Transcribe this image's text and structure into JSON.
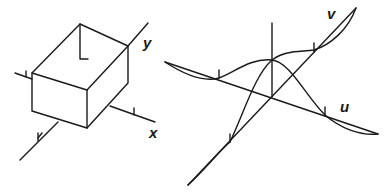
{
  "left_figure": {
    "description": "3D box with x and y axes",
    "labels": {
      "y": "y",
      "x": "x"
    }
  },
  "right_figure": {
    "description": "3D surface/curve plot with u and v axes",
    "labels": {
      "v": "v",
      "u": "u"
    }
  },
  "colors": {
    "stroke": "#1a1a1a",
    "background": "#ffffff"
  }
}
